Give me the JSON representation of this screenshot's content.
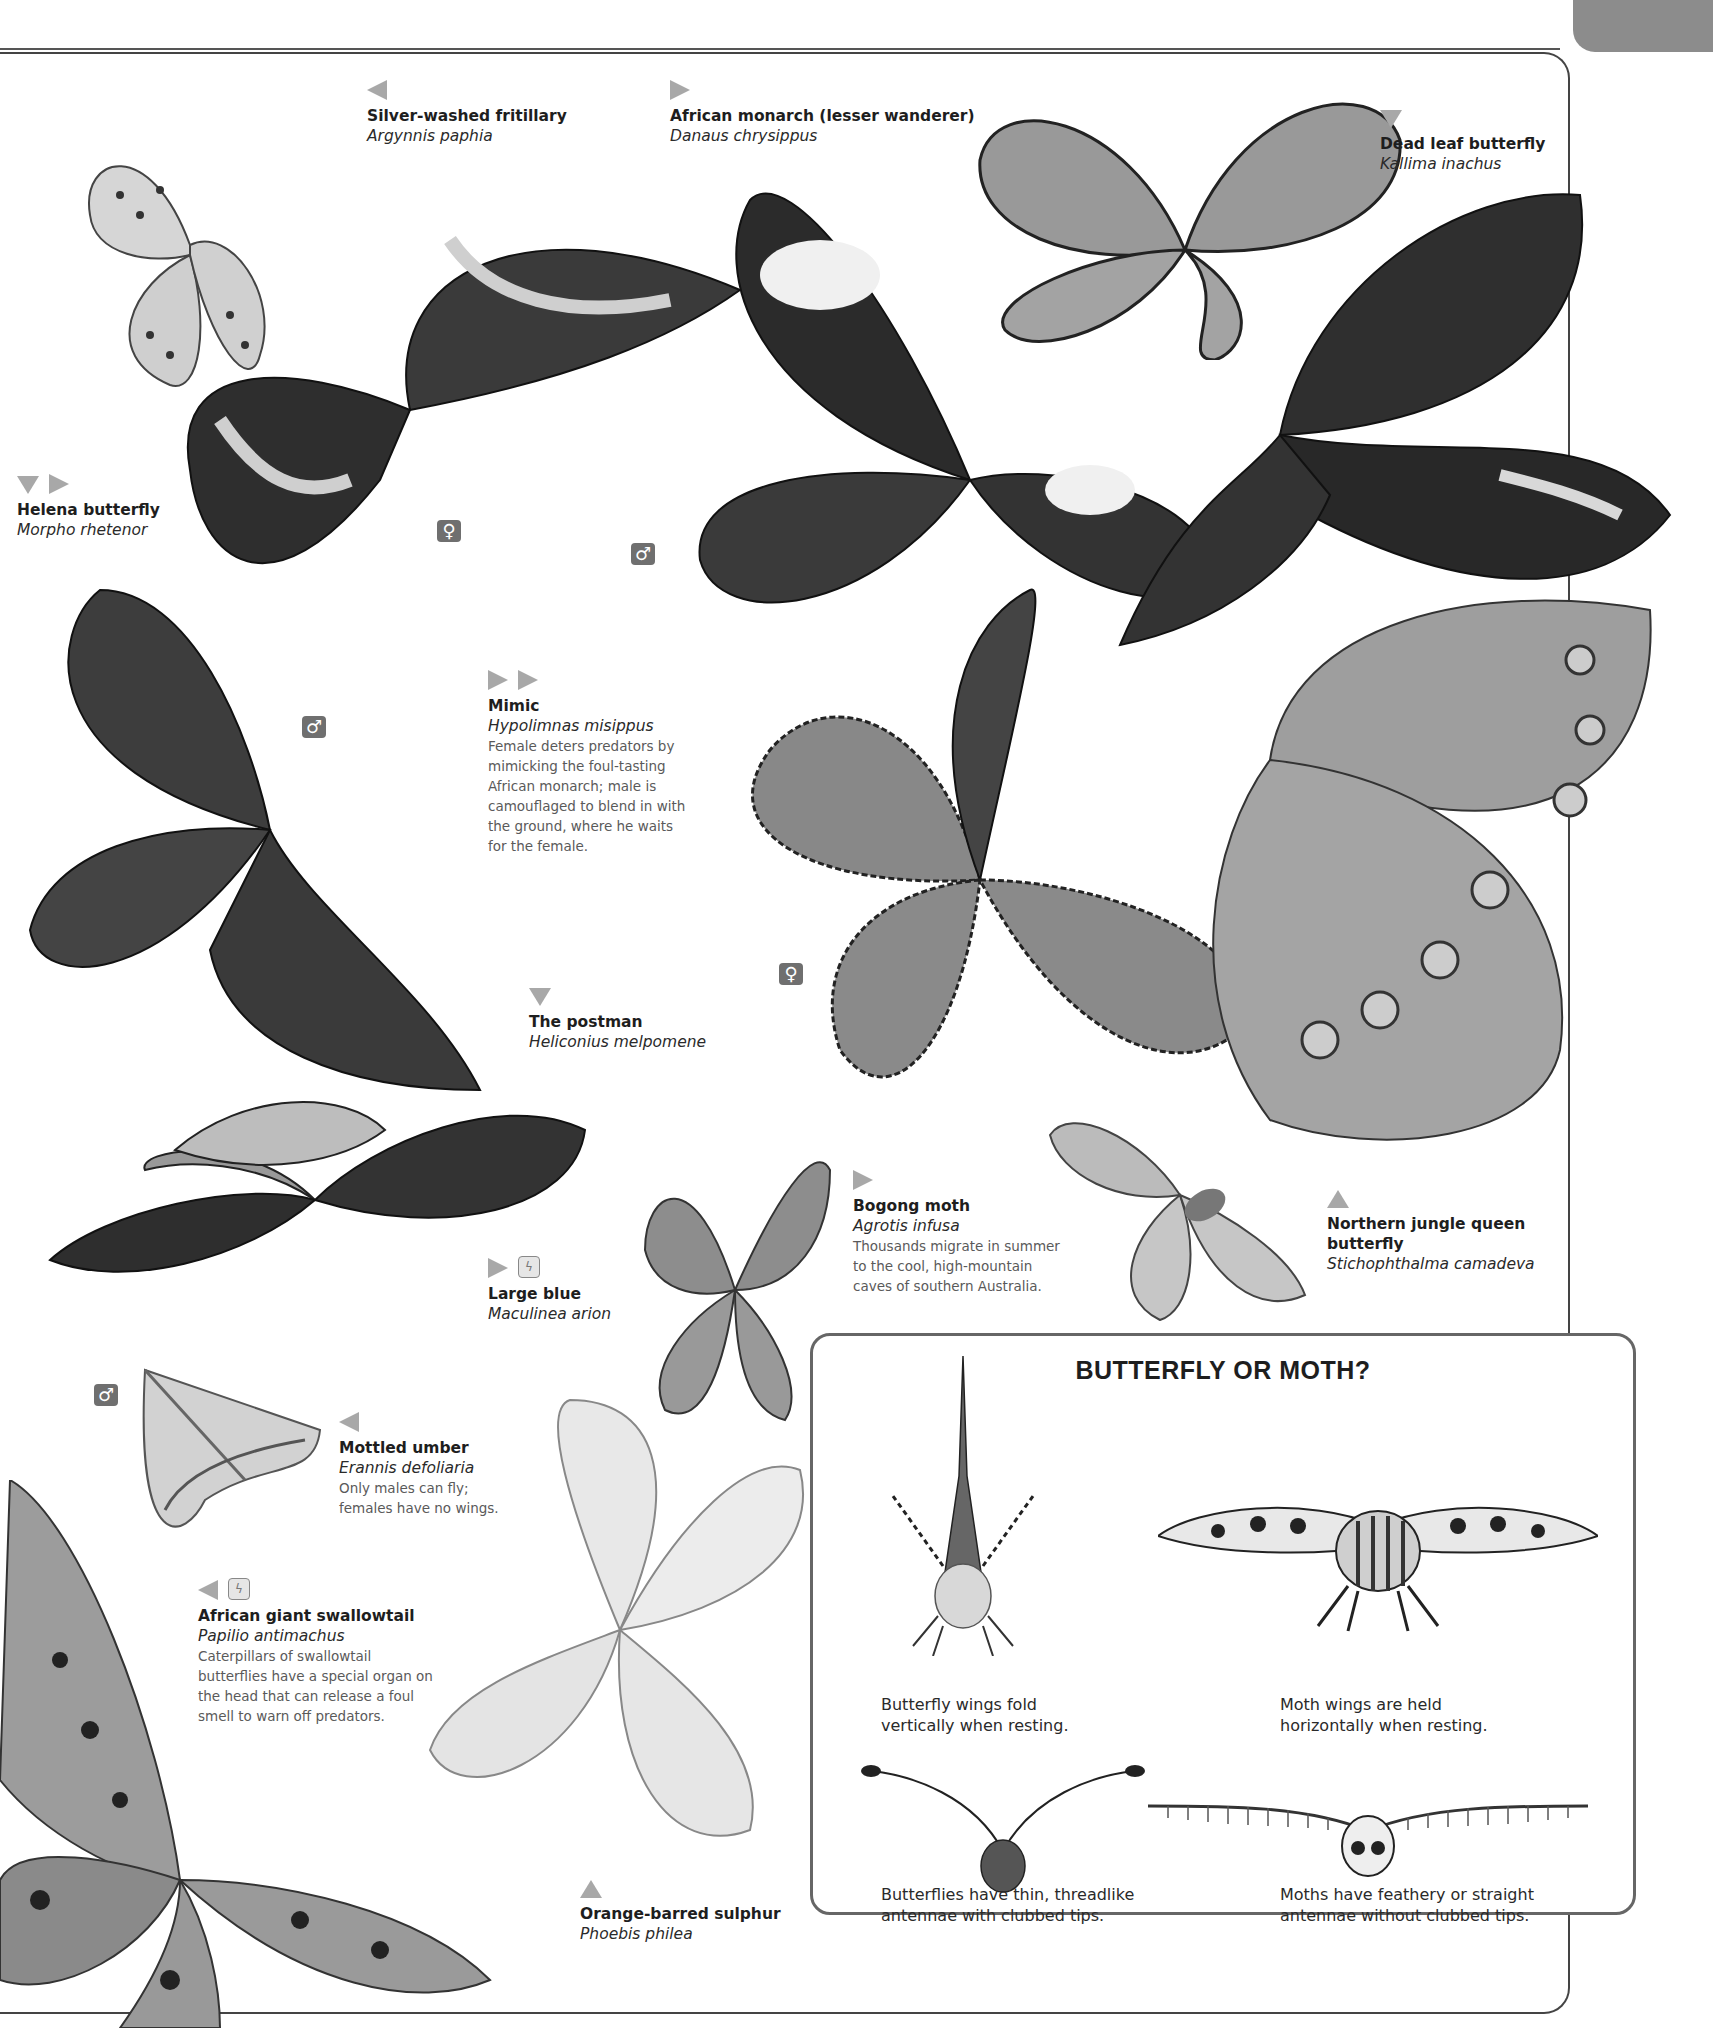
{
  "page": {
    "corner_tab_color": "#8c8c8c",
    "marker_color": "#a8a8a8",
    "sex_badge_color": "#6f6f6f"
  },
  "species": [
    {
      "common": "Silver-washed fritillary",
      "latin": "Argynnis paphia",
      "markers": [
        "left"
      ]
    },
    {
      "common": "African monarch (lesser wanderer)",
      "latin": "Danaus chrysippus",
      "markers": [
        "right"
      ]
    },
    {
      "common": "Dead leaf butterfly",
      "latin": "Kallima inachus",
      "markers": [
        "down"
      ]
    },
    {
      "common": "Helena butterfly",
      "latin": "Morpho rhetenor",
      "markers": [
        "down",
        "right"
      ]
    },
    {
      "common": "Mimic",
      "latin": "Hypolimnas misippus",
      "markers": [
        "right",
        "right"
      ],
      "desc": "Female deters predators by mimicking the foul-tasting African monarch; male is camouflaged to blend in with the ground, where he waits for the female."
    },
    {
      "common": "The postman",
      "latin": "Heliconius melpomene",
      "markers": [
        "down"
      ]
    },
    {
      "common": "Bogong moth",
      "latin": "Agrotis infusa",
      "markers": [
        "right"
      ],
      "desc": "Thousands migrate in summer to the cool, high-mountain caves of southern Australia."
    },
    {
      "common": "Northern jungle queen butterfly",
      "latin": "Stichophthalma camadeva",
      "markers": [
        "up"
      ]
    },
    {
      "common": "Large blue",
      "latin": "Maculinea arion",
      "markers": [
        "right",
        "endangered"
      ]
    },
    {
      "common": "Mottled umber",
      "latin": "Erannis defoliaria",
      "markers": [
        "left"
      ],
      "desc": "Only males can fly; females have no wings."
    },
    {
      "common": "African giant swallowtail",
      "latin": "Papilio antimachus",
      "markers": [
        "left",
        "endangered"
      ],
      "desc": "Caterpillars of swallowtail butterflies have a special organ on the head that can release a foul smell to warn off predators."
    },
    {
      "common": "Orange-barred sulphur",
      "latin": "Phoebis philea",
      "markers": [
        "up"
      ]
    }
  ],
  "sex_badges": {
    "female": "♀",
    "male": "♂"
  },
  "info_box": {
    "title": "BUTTERFLY OR MOTH?",
    "captions": {
      "butterfly_wings": "Butterfly wings fold vertically when resting.",
      "moth_wings": "Moth wings are held horizontally when resting.",
      "butterfly_antennae": "Butterflies have thin, threadlike antennae with clubbed tips.",
      "moth_antennae": "Moths have feathery or straight antennae without clubbed tips."
    }
  }
}
